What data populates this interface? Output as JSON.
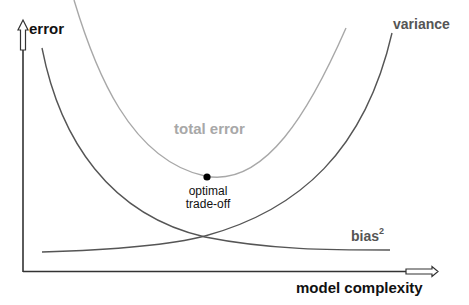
{
  "diagram": {
    "y_axis_label": "error",
    "x_axis_label": "model complexity",
    "curves": [
      {
        "name": "total error",
        "label": "total error",
        "color": "#a0a0a0"
      },
      {
        "name": "variance",
        "label": "variance",
        "color": "#555555"
      },
      {
        "name": "bias2",
        "label_base": "bias",
        "label_sup": "2",
        "color": "#555555"
      }
    ],
    "optimum": {
      "label_line1": "optimal",
      "label_line2": "trade-off",
      "color": "#000000"
    }
  }
}
